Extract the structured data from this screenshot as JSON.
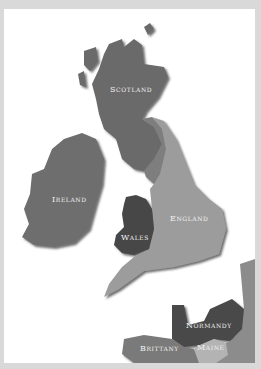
{
  "map": {
    "regions": [
      {
        "name": "Scotland",
        "label": "Scotland",
        "color": "#6a6a6a"
      },
      {
        "name": "Ireland",
        "label": "Ireland",
        "color": "#6e6e6e"
      },
      {
        "name": "Wales",
        "label": "Wales",
        "color": "#474747"
      },
      {
        "name": "England",
        "label": "England",
        "color": "#9c9c9c"
      },
      {
        "name": "Normandy",
        "label": "Normandy",
        "color": "#4a4a4a"
      },
      {
        "name": "Brittany",
        "label": "Brittany",
        "color": "#7a7a7a"
      },
      {
        "name": "Maine",
        "label": "Maine",
        "color": "#b3b3b3"
      }
    ],
    "background": "#ffffff",
    "border": "#d9d9d9"
  }
}
